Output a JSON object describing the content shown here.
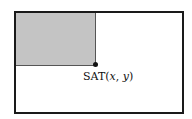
{
  "diagram": {
    "label_prefix": "SAT(",
    "var_x": "x",
    "separator": ", ",
    "var_y": "y",
    "label_suffix": ")",
    "colors": {
      "border": "#1a1a1a",
      "shaded_region": "#c4c4c4",
      "point": "#111111"
    }
  }
}
